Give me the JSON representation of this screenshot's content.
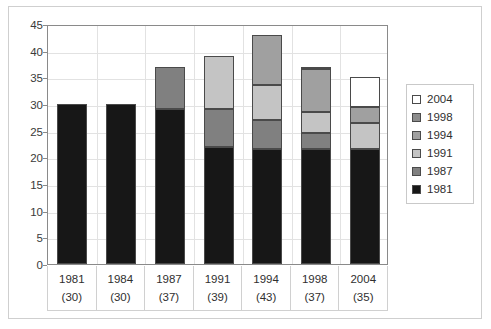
{
  "chart_data": {
    "type": "bar",
    "subtype": "stacked-bar",
    "title": "",
    "xlabel": "",
    "ylabel": "",
    "ylim": [
      0,
      45
    ],
    "ytick_step": 5,
    "yticks": [
      "45",
      "40",
      "35",
      "30",
      "25",
      "20",
      "15",
      "10",
      "5",
      "0"
    ],
    "grid": true,
    "legend_position": "right",
    "categories": [
      "1981",
      "1984",
      "1987",
      "1991",
      "1994",
      "1998",
      "2004"
    ],
    "category_totals": [
      "(30)",
      "(30)",
      "(37)",
      "(39)",
      "(43)",
      "(37)",
      "(35)"
    ],
    "category_total_values": [
      30,
      30,
      37,
      39,
      43,
      37,
      35
    ],
    "series": [
      {
        "name": "1981",
        "color": "#171717",
        "values": [
          30,
          30,
          29,
          22,
          21.5,
          21.5,
          21.5
        ]
      },
      {
        "name": "1987",
        "color": "#808080",
        "values": [
          0,
          0,
          8,
          7,
          5.5,
          3,
          0
        ]
      },
      {
        "name": "1991",
        "color": "#c4c4c4",
        "values": [
          0,
          0,
          0,
          10,
          6.5,
          4,
          5
        ]
      },
      {
        "name": "1994",
        "color": "#a0a0a0",
        "values": [
          0,
          0,
          0,
          0,
          9.5,
          8,
          3
        ]
      },
      {
        "name": "1998",
        "color": "#8c8c8c",
        "values": [
          0,
          0,
          0,
          0,
          0,
          0.5,
          0
        ]
      },
      {
        "name": "2004",
        "color": "#ffffff",
        "values": [
          0,
          0,
          0,
          0,
          0,
          0,
          5.5
        ]
      }
    ],
    "legend_entries": [
      {
        "label": "2004",
        "color": "#ffffff"
      },
      {
        "label": "1998",
        "color": "#8c8c8c"
      },
      {
        "label": "1994",
        "color": "#a0a0a0"
      },
      {
        "label": "1991",
        "color": "#c4c4c4"
      },
      {
        "label": "1987",
        "color": "#808080"
      },
      {
        "label": "1981",
        "color": "#171717"
      }
    ]
  }
}
